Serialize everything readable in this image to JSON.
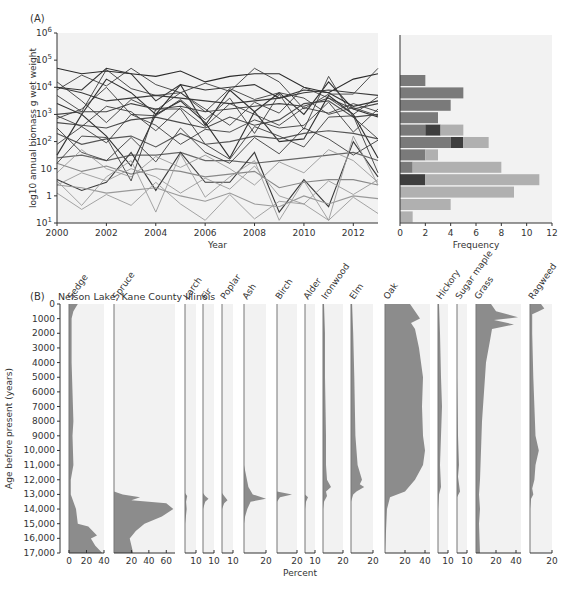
{
  "chart_data": [
    {
      "panel": "A-left",
      "type": "line",
      "title": "",
      "panel_label": "(A)",
      "xlabel": "Year",
      "ylabel": "log10 annual biomass g wet weight",
      "x": [
        2000,
        2001,
        2002,
        2003,
        2004,
        2005,
        2006,
        2007,
        2008,
        2009,
        2010,
        2011,
        2012,
        2013
      ],
      "x_ticks": [
        "2000",
        "2002",
        "2004",
        "2006",
        "2008",
        "2010",
        "2012"
      ],
      "y_ticks": [
        "10^1",
        "1",
        "10",
        "10^2",
        "10^3",
        "10^4",
        "10^5",
        "10^6"
      ],
      "y_scale": "log",
      "ylim_exponent": [
        -1,
        6
      ],
      "grid": false,
      "series_note": "~45 species time series, dark (high biomass) to light gray (low biomass)",
      "series": [
        {
          "name": "s1",
          "values_log10": [
            4.7,
            4.5,
            4.6,
            4.5,
            4.4,
            4.6,
            4.2,
            4.4,
            4.5,
            4.5,
            4.0,
            3.8,
            4.3,
            4.5
          ]
        },
        {
          "name": "s2",
          "values_log10": [
            4.0,
            3.9,
            4.7,
            4.5,
            3.5,
            4.1,
            3.9,
            4.0,
            4.1,
            3.6,
            3.9,
            3.8,
            3.3,
            3.5
          ]
        },
        {
          "name": "s3",
          "values_log10": [
            4.0,
            3.8,
            3.5,
            3.6,
            3.7,
            3.6,
            3.5,
            3.4,
            3.5,
            3.6,
            3.8,
            3.9,
            3.8,
            3.7
          ]
        },
        {
          "name": "s4",
          "values_log10": [
            3.4,
            3.0,
            4.3,
            3.8,
            3.0,
            4.1,
            2.6,
            3.9,
            3.1,
            3.8,
            3.0,
            4.2,
            3.2,
            2.9
          ]
        },
        {
          "name": "s5",
          "values_log10": [
            3.0,
            3.1,
            3.1,
            3.4,
            3.2,
            3.3,
            3.1,
            3.2,
            3.3,
            3.4,
            3.3,
            3.6,
            3.2,
            3.4
          ]
        },
        {
          "name": "s6",
          "values_log10": [
            2.7,
            2.6,
            2.5,
            2.8,
            2.9,
            2.7,
            2.5,
            2.9,
            2.6,
            2.8,
            3.4,
            3.5,
            2.9,
            3.0
          ]
        },
        {
          "name": "s7",
          "values_log10": [
            1.5,
            3.0,
            2.2,
            1.1,
            3.0,
            3.5,
            2.7,
            1.4,
            3.1,
            2.0,
            2.1,
            3.7,
            3.0,
            1.4
          ]
        },
        {
          "name": "s8",
          "values_log10": [
            2.3,
            1.9,
            2.1,
            2.2,
            1.8,
            2.3,
            1.9,
            2.0,
            2.2,
            2.1,
            2.3,
            2.4,
            2.3,
            2.1
          ]
        },
        {
          "name": "s9",
          "values_log10": [
            1.4,
            1.5,
            1.3,
            1.5,
            1.5,
            1.6,
            1.3,
            1.3,
            1.2,
            1.3,
            1.4,
            1.5,
            1.6,
            1.3
          ]
        },
        {
          "name": "s10",
          "values_log10": [
            0.6,
            0.2,
            0.5,
            1.6,
            0.2,
            1.6,
            0.5,
            0.5,
            1.6,
            -0.6,
            0.6,
            -0.4,
            2.0,
            0.7
          ]
        },
        {
          "name": "s11",
          "values_log10": [
            1.2,
            0.9,
            1.1,
            0.8,
            1.0,
            0.9,
            0.7,
            0.8,
            0.9,
            0.3,
            0.5,
            0.6,
            0.6,
            0.4
          ]
        },
        {
          "name": "s12",
          "values_log10": [
            0.4,
            0.3,
            0.1,
            0.2,
            0.3,
            0.0,
            -0.2,
            0.1,
            -0.3,
            -0.4,
            0.0,
            -0.3,
            0.0,
            -0.1
          ]
        }
      ]
    },
    {
      "panel": "A-right",
      "type": "bar",
      "orientation": "horizontal",
      "xlabel": "Frequency",
      "x_ticks": [
        "0",
        "2",
        "4",
        "6",
        "8",
        "10",
        "12"
      ],
      "xlim": [
        0,
        12
      ],
      "grid": false,
      "bins_note": "bins of log10 biomass, top (high) to bottom (low); stacked dark/medium/light gray",
      "categories": [
        "bin1",
        "bin2",
        "bin3",
        "bin4",
        "bin5",
        "bin6",
        "bin7",
        "bin8",
        "bin9",
        "bin10",
        "bin11",
        "bin12"
      ],
      "series": [
        {
          "name": "medium-dark",
          "color": "#7a7a7a",
          "values": [
            2,
            5,
            4,
            3,
            2,
            4,
            2,
            1,
            0,
            0,
            0,
            0
          ]
        },
        {
          "name": "darkest",
          "color": "#3e3e3e",
          "values": [
            0,
            0,
            0,
            0,
            1.2,
            1,
            0,
            0,
            2,
            0,
            0,
            0
          ]
        },
        {
          "name": "light",
          "color": "#b0b0b0",
          "values": [
            0,
            0,
            0,
            0,
            1.8,
            2,
            1,
            7,
            9,
            9,
            4,
            1
          ]
        }
      ],
      "totals": [
        2,
        5,
        4,
        3,
        5,
        7,
        3,
        8,
        11,
        9,
        4,
        1
      ]
    },
    {
      "panel": "B",
      "type": "area",
      "panel_label": "(B)",
      "title": "Nelson Lake, Kane County Illinois",
      "xlabel": "Percent",
      "ylabel": "Age before present (years)",
      "y_ticks": [
        "0",
        "1000",
        "2000",
        "3000",
        "4000",
        "5000",
        "6000",
        "7000",
        "8000",
        "9000",
        "10,000",
        "11,000",
        "12,000",
        "13,000",
        "14,000",
        "15,000",
        "16,000",
        "17,000"
      ],
      "ylim": [
        0,
        17000
      ],
      "taxa": [
        {
          "name": "Sedge",
          "x_ticks": [
            "0",
            "20",
            "40"
          ],
          "max": 40,
          "profile": [
            [
              0,
              10
            ],
            [
              500,
              5
            ],
            [
              1000,
              3
            ],
            [
              2000,
              3
            ],
            [
              4000,
              3
            ],
            [
              8000,
              5
            ],
            [
              9000,
              4
            ],
            [
              11000,
              5
            ],
            [
              12000,
              2
            ],
            [
              13000,
              2
            ],
            [
              14000,
              8
            ],
            [
              15000,
              10
            ],
            [
              15200,
              22
            ],
            [
              15800,
              32
            ],
            [
              16000,
              25
            ],
            [
              16500,
              30
            ],
            [
              17000,
              38
            ]
          ]
        },
        {
          "name": "Spruce",
          "x_ticks": [
            "20",
            "40",
            "60"
          ],
          "max": 70,
          "profile": [
            [
              0,
              0
            ],
            [
              12800,
              0
            ],
            [
              13000,
              10
            ],
            [
              13200,
              30
            ],
            [
              13400,
              20
            ],
            [
              13600,
              60
            ],
            [
              14000,
              68
            ],
            [
              14500,
              55
            ],
            [
              15000,
              35
            ],
            [
              15500,
              25
            ],
            [
              16000,
              18
            ],
            [
              17000,
              22
            ]
          ]
        },
        {
          "name": "Larch",
          "x_ticks": [
            "10"
          ],
          "max": 10,
          "profile": [
            [
              0,
              0
            ],
            [
              12900,
              0
            ],
            [
              13100,
              2
            ],
            [
              13500,
              1
            ],
            [
              14000,
              1.5
            ],
            [
              14500,
              0.8
            ],
            [
              15000,
              0
            ]
          ]
        },
        {
          "name": "Fir",
          "x_ticks": [
            "10"
          ],
          "max": 10,
          "profile": [
            [
              0,
              0
            ],
            [
              12900,
              0
            ],
            [
              13100,
              2
            ],
            [
              13300,
              5
            ],
            [
              13500,
              2
            ],
            [
              14000,
              0
            ]
          ]
        },
        {
          "name": "Poplar",
          "x_ticks": [
            "10"
          ],
          "max": 10,
          "profile": [
            [
              0,
              0
            ],
            [
              12900,
              0
            ],
            [
              13100,
              2
            ],
            [
              13400,
              5
            ],
            [
              13600,
              2
            ],
            [
              14000,
              0
            ]
          ]
        },
        {
          "name": "Ash",
          "x_ticks": [
            "20"
          ],
          "max": 20,
          "profile": [
            [
              0,
              0
            ],
            [
              11000,
              0
            ],
            [
              12500,
              4
            ],
            [
              13000,
              8
            ],
            [
              13300,
              20
            ],
            [
              13500,
              6
            ],
            [
              14000,
              3
            ],
            [
              14500,
              1
            ],
            [
              15000,
              0
            ]
          ]
        },
        {
          "name": "Birch",
          "x_ticks": [
            "20"
          ],
          "max": 20,
          "profile": [
            [
              0,
              0
            ],
            [
              12800,
              0
            ],
            [
              13000,
              15
            ],
            [
              13200,
              3
            ],
            [
              13500,
              0
            ]
          ]
        },
        {
          "name": "Alder",
          "x_ticks": [
            "10"
          ],
          "max": 10,
          "profile": [
            [
              0,
              0
            ],
            [
              13000,
              0
            ],
            [
              13200,
              3
            ],
            [
              13500,
              1
            ],
            [
              14000,
              0
            ]
          ]
        },
        {
          "name": "Ironwood",
          "x_ticks": [
            "20"
          ],
          "max": 20,
          "profile": [
            [
              0,
              1
            ],
            [
              2000,
              2
            ],
            [
              5000,
              2
            ],
            [
              9000,
              3
            ],
            [
              11000,
              3
            ],
            [
              12000,
              4
            ],
            [
              12500,
              8
            ],
            [
              12800,
              3
            ],
            [
              13100,
              4
            ],
            [
              13500,
              1
            ],
            [
              14000,
              0
            ]
          ]
        },
        {
          "name": "Elm",
          "x_ticks": [
            "20"
          ],
          "max": 20,
          "profile": [
            [
              0,
              1
            ],
            [
              2000,
              2
            ],
            [
              5000,
              3
            ],
            [
              9000,
              4
            ],
            [
              10000,
              5
            ],
            [
              11000,
              6
            ],
            [
              12000,
              10
            ],
            [
              12300,
              8
            ],
            [
              12500,
              12
            ],
            [
              12800,
              5
            ],
            [
              13000,
              2
            ],
            [
              13500,
              0
            ]
          ]
        },
        {
          "name": "Oak",
          "x_ticks": [
            "20",
            "40"
          ],
          "max": 45,
          "profile": [
            [
              0,
              25
            ],
            [
              500,
              30
            ],
            [
              1000,
              35
            ],
            [
              1300,
              26
            ],
            [
              1700,
              30
            ],
            [
              3000,
              34
            ],
            [
              5000,
              38
            ],
            [
              7000,
              37
            ],
            [
              9000,
              38
            ],
            [
              10000,
              40
            ],
            [
              11000,
              38
            ],
            [
              12000,
              30
            ],
            [
              12800,
              20
            ],
            [
              13200,
              5
            ],
            [
              14000,
              2
            ],
            [
              17000,
              0
            ]
          ]
        },
        {
          "name": "Hickory",
          "x_ticks": [
            "10"
          ],
          "max": 10,
          "profile": [
            [
              0,
              1
            ],
            [
              2000,
              2
            ],
            [
              5000,
              3
            ],
            [
              7000,
              4
            ],
            [
              9000,
              3
            ],
            [
              11000,
              2
            ],
            [
              12500,
              3
            ],
            [
              13000,
              1
            ],
            [
              14000,
              0
            ]
          ]
        },
        {
          "name": "Sugar maple",
          "x_ticks": [
            "10"
          ],
          "max": 10,
          "profile": [
            [
              0,
              0
            ],
            [
              5000,
              0
            ],
            [
              9000,
              1
            ],
            [
              11000,
              2
            ],
            [
              11800,
              1
            ],
            [
              12800,
              3
            ],
            [
              13200,
              0
            ]
          ]
        },
        {
          "name": "Grass",
          "x_ticks": [
            "20",
            "40"
          ],
          "max": 45,
          "profile": [
            [
              0,
              15
            ],
            [
              500,
              20
            ],
            [
              900,
              42
            ],
            [
              1100,
              18
            ],
            [
              1400,
              38
            ],
            [
              1700,
              16
            ],
            [
              2500,
              14
            ],
            [
              4000,
              10
            ],
            [
              6000,
              8
            ],
            [
              8000,
              6
            ],
            [
              10000,
              5
            ],
            [
              12000,
              4
            ],
            [
              13000,
              3
            ],
            [
              14000,
              4
            ],
            [
              15000,
              3
            ],
            [
              17000,
              4
            ]
          ]
        },
        {
          "name": "Ragweed",
          "x_ticks": [
            "20"
          ],
          "max": 20,
          "profile": [
            [
              0,
              10
            ],
            [
              300,
              13
            ],
            [
              500,
              8
            ],
            [
              700,
              2
            ],
            [
              2000,
              2
            ],
            [
              5000,
              3
            ],
            [
              7000,
              4
            ],
            [
              9000,
              5
            ],
            [
              10000,
              8
            ],
            [
              11000,
              5
            ],
            [
              12000,
              4
            ],
            [
              12600,
              2
            ],
            [
              13000,
              3
            ],
            [
              13300,
              1
            ],
            [
              14000,
              0
            ]
          ]
        }
      ]
    }
  ]
}
